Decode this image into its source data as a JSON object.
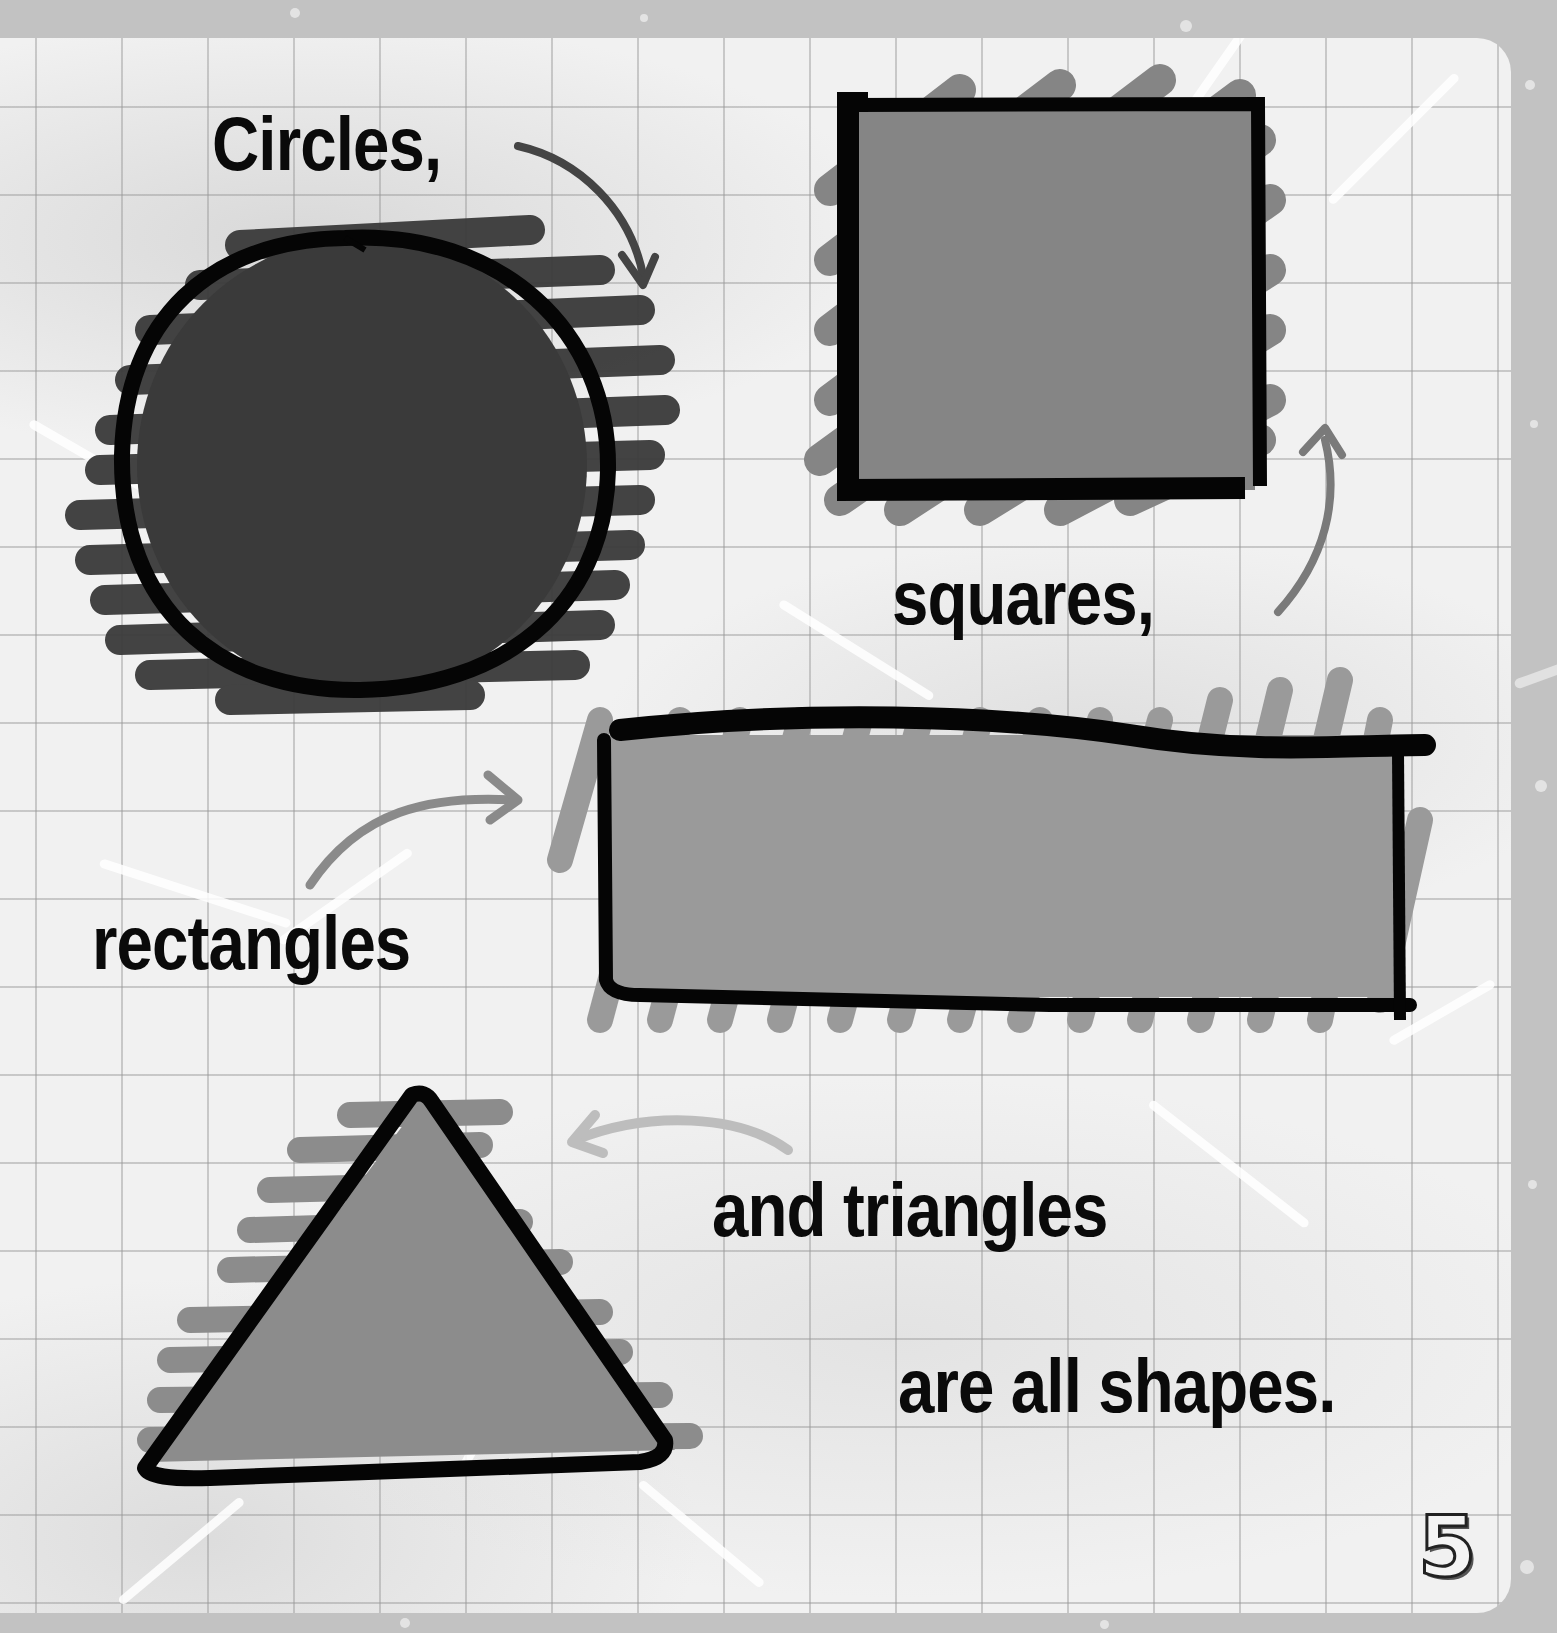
{
  "page": {
    "background_color": "#c2c2c2",
    "paper_color": "#f1f1f1",
    "grid_color": "#969696",
    "page_number": "5"
  },
  "captions": {
    "circles": "Circles,",
    "squares": "squares,",
    "rectangles": "rectangles",
    "triangles": "and triangles",
    "conclusion": "are all shapes."
  },
  "shapes": [
    {
      "name": "circle",
      "fill": "#3a3a3a",
      "outline": "#000000"
    },
    {
      "name": "square",
      "fill": "#858585",
      "outline": "#000000"
    },
    {
      "name": "rectangle",
      "fill": "#9a9a9a",
      "outline": "#000000"
    },
    {
      "name": "triangle",
      "fill": "#8c8c8c",
      "outline": "#000000"
    }
  ],
  "arrows": [
    {
      "from": "circles-caption",
      "to": "circle",
      "color": "#444444"
    },
    {
      "from": "squares-caption",
      "to": "square",
      "color": "#7a7a7a"
    },
    {
      "from": "rectangles-caption",
      "to": "rectangle",
      "color": "#8a8a8a"
    },
    {
      "from": "triangles-caption",
      "to": "triangle",
      "color": "#bdbdbd"
    }
  ]
}
